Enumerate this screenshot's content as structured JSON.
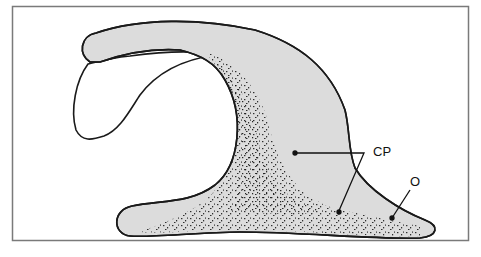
{
  "figure": {
    "frame_color": "#7a7a7a",
    "shape_fill": "#dcdcdc",
    "outline_color": "#1a1a1a",
    "stipple_color": "#111111"
  },
  "labels": {
    "cp": "CP",
    "o": "O"
  }
}
